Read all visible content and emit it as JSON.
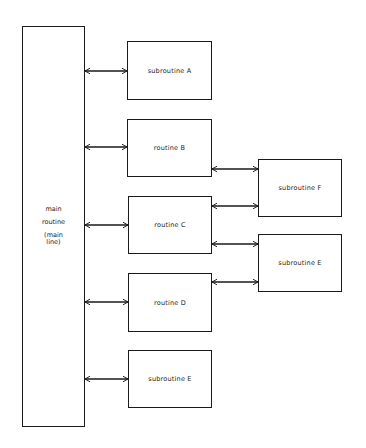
{
  "diagram": {
    "main": {
      "label_lines": [
        "main",
        "routine",
        "(main",
        "line)"
      ]
    },
    "routines": [
      {
        "id": "sub-a",
        "label": "subroutine A"
      },
      {
        "id": "routine-b",
        "label": "routine B"
      },
      {
        "id": "routine-c",
        "label": "routine C"
      },
      {
        "id": "routine-d",
        "label": "routine D"
      },
      {
        "id": "sub-e-bottom",
        "label": "subroutine E"
      }
    ],
    "secondary": [
      {
        "id": "sub-f",
        "label": "subroutine F"
      },
      {
        "id": "sub-e-right",
        "label": "subroutine E"
      }
    ],
    "connections": [
      {
        "from": "main",
        "to": "subroutine A",
        "type": "bidirectional"
      },
      {
        "from": "main",
        "to": "routine B",
        "type": "bidirectional"
      },
      {
        "from": "main",
        "to": "routine C",
        "type": "bidirectional"
      },
      {
        "from": "main",
        "to": "routine D",
        "type": "bidirectional"
      },
      {
        "from": "main",
        "to": "subroutine E",
        "type": "bidirectional"
      },
      {
        "from": "routine B",
        "to": "subroutine F",
        "type": "bidirectional"
      },
      {
        "from": "routine C",
        "to": "subroutine F",
        "type": "bidirectional"
      },
      {
        "from": "routine C",
        "to": "subroutine E",
        "type": "bidirectional"
      },
      {
        "from": "routine D",
        "to": "subroutine E",
        "type": "bidirectional"
      }
    ]
  }
}
